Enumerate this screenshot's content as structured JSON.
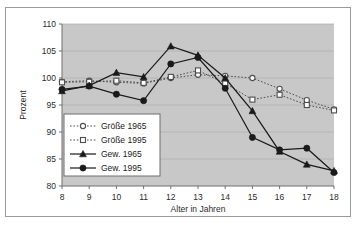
{
  "chart_data": {
    "type": "line",
    "title": "",
    "xlabel": "Alter in Jahren",
    "ylabel": "Prozent",
    "x": [
      8,
      9,
      10,
      11,
      12,
      13,
      14,
      15,
      16,
      17,
      18
    ],
    "xtick_labels": [
      "8",
      "9",
      "10",
      "11",
      "12",
      "13",
      "14",
      "15",
      "16",
      "17",
      "18"
    ],
    "ytick_labels": [
      "80",
      "85",
      "90",
      "95",
      "100",
      "105",
      "110"
    ],
    "ylim": [
      80,
      110
    ],
    "xlim": [
      8,
      18
    ],
    "grid": true,
    "plot_background": "#c8c8c8",
    "legend_position": "inside-lower-left",
    "series": [
      {
        "name": "Größe 1965",
        "marker": "open-circle",
        "line": "dotted",
        "color": "#4d4d4d",
        "values": [
          99.3,
          99.5,
          99.2,
          99.0,
          100.0,
          100.6,
          100.4,
          100.0,
          98.0,
          95.9,
          94.2
        ]
      },
      {
        "name": "Größe 1995",
        "marker": "open-square",
        "line": "dotted",
        "color": "#4d4d4d",
        "values": [
          99.2,
          99.3,
          99.5,
          99.1,
          100.2,
          101.4,
          99.0,
          96.0,
          96.9,
          95.0,
          94.0
        ]
      },
      {
        "name": "Gew. 1965",
        "marker": "filled-triangle",
        "line": "solid",
        "color": "#1a1a1a",
        "values": [
          97.6,
          98.6,
          101.0,
          100.2,
          105.9,
          104.2,
          100.0,
          93.9,
          86.4,
          84.0,
          82.8
        ]
      },
      {
        "name": "Gew. 1995",
        "marker": "filled-circle",
        "line": "solid",
        "color": "#1a1a1a",
        "values": [
          97.9,
          98.5,
          97.0,
          95.8,
          102.6,
          103.8,
          98.1,
          89.0,
          86.7,
          87.0,
          82.5
        ]
      }
    ]
  },
  "legend": {
    "items": [
      {
        "label": "Größe 1965"
      },
      {
        "label": "Größe 1995"
      },
      {
        "label": "Gew. 1965"
      },
      {
        "label": "Gew. 1995"
      }
    ]
  }
}
